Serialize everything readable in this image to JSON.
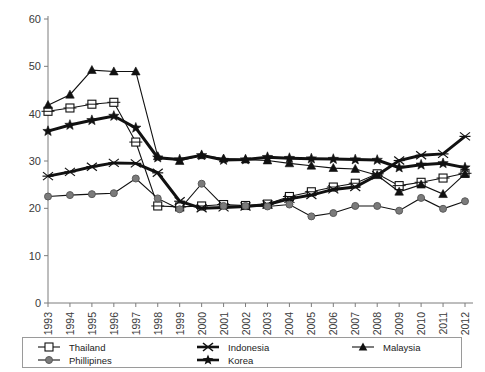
{
  "chart_data": {
    "type": "line",
    "title": "",
    "subtitle": "",
    "xlabel": "",
    "ylabel": "",
    "xlim": [
      1993,
      2012
    ],
    "ylim": [
      0,
      60
    ],
    "ytick_step": 10,
    "grid": false,
    "legend_position": "bottom",
    "categories": [
      "1993",
      "1994",
      "1995",
      "1996",
      "1997",
      "1998",
      "1999",
      "2000",
      "2001",
      "2002",
      "2003",
      "2004",
      "2005",
      "2006",
      "2007",
      "2008",
      "2009",
      "2010",
      "2011",
      "2012"
    ],
    "yticks": [
      "0",
      "10",
      "20",
      "30",
      "40",
      "50",
      "60"
    ],
    "series": [
      {
        "name": "Thailand",
        "marker": "open-square",
        "line": "thin",
        "values": [
          40.5,
          41.2,
          42.0,
          42.4,
          34.0,
          20.5,
          20.3,
          20.5,
          20.8,
          20.6,
          20.9,
          22.5,
          23.5,
          24.5,
          25.3,
          27.3,
          24.8,
          25.5,
          26.4,
          27.4
        ]
      },
      {
        "name": "Indonesia",
        "marker": "x-star",
        "line": "thick",
        "values": [
          26.8,
          27.7,
          28.8,
          29.6,
          29.5,
          27.5,
          21.5,
          20.0,
          20.2,
          20.4,
          20.8,
          22.0,
          22.8,
          24.0,
          24.5,
          27.0,
          30.1,
          31.2,
          31.5,
          35.2
        ]
      },
      {
        "name": "Malaysia",
        "marker": "triangle",
        "line": "thin",
        "values": [
          41.8,
          44.0,
          49.2,
          48.9,
          48.9,
          31.0,
          30.0,
          31.2,
          30.5,
          30.3,
          30.1,
          29.5,
          29.0,
          28.5,
          28.3,
          27.0,
          23.5,
          25.0,
          23.0,
          27.3
        ]
      },
      {
        "name": "Phillipines",
        "marker": "filled-circle",
        "line": "thin",
        "values": [
          22.5,
          22.8,
          23.0,
          23.2,
          26.3,
          22.1,
          19.8,
          25.2,
          20.5,
          20.5,
          20.4,
          20.8,
          18.3,
          19.0,
          20.5,
          20.5,
          19.5,
          22.2,
          19.9,
          21.5
        ]
      },
      {
        "name": "Korea",
        "marker": "solid-star",
        "line": "thick",
        "values": [
          36.3,
          37.6,
          38.6,
          39.5,
          37.0,
          30.7,
          30.3,
          31.2,
          30.2,
          30.3,
          30.8,
          30.6,
          30.5,
          30.4,
          30.3,
          30.2,
          28.6,
          29.2,
          29.5,
          28.6
        ]
      }
    ]
  },
  "legend": {
    "entries": [
      {
        "label": "Thailand",
        "marker": "open-square"
      },
      {
        "label": "Indonesia",
        "marker": "x-star"
      },
      {
        "label": "Malaysia",
        "marker": "triangle"
      },
      {
        "label": "Phillipines",
        "marker": "filled-circle"
      },
      {
        "label": "Korea",
        "marker": "solid-star"
      }
    ]
  },
  "colors": {
    "line": "#111111",
    "axis": "#7d7d7d",
    "marker_grey": "#7b7b7b",
    "background": "#ffffff"
  }
}
